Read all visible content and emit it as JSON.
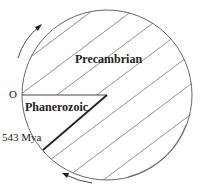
{
  "diagram": {
    "regions": [
      {
        "name": "Precambrian",
        "style": "hatched"
      },
      {
        "name": "Phanerozoic",
        "style": "plain"
      }
    ],
    "labels": {
      "origin": "O",
      "precambrian": "Precambrian",
      "phanerozoic": "Phanerozoic",
      "boundary": "543 Mya"
    },
    "arrows": [
      "counterclockwise-top-left",
      "clockwise-bottom"
    ],
    "colors": {
      "line": "#555555",
      "boundary": "#222222",
      "background": "#ffffff"
    }
  }
}
